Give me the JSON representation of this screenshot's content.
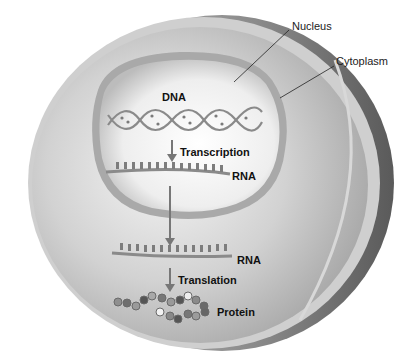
{
  "figure": {
    "type": "cell diagram"
  },
  "labels": {
    "nucleus": "Nucleus",
    "cytoplasm": "Cytoplasm",
    "dna": "DNA",
    "transcription": "Transcription",
    "rna_nuclear": "RNA",
    "rna_cytoplasmic": "RNA",
    "translation": "Translation",
    "protein": "Protein"
  },
  "colors": {
    "background": "#ffffff",
    "cell_outer_shell": "#6e6e6e",
    "cytoplasm": "#bdbdbd",
    "nucleus_interior": "#ececec",
    "arrow": "#777777",
    "text": "#111111",
    "leader_line": "#222222"
  }
}
